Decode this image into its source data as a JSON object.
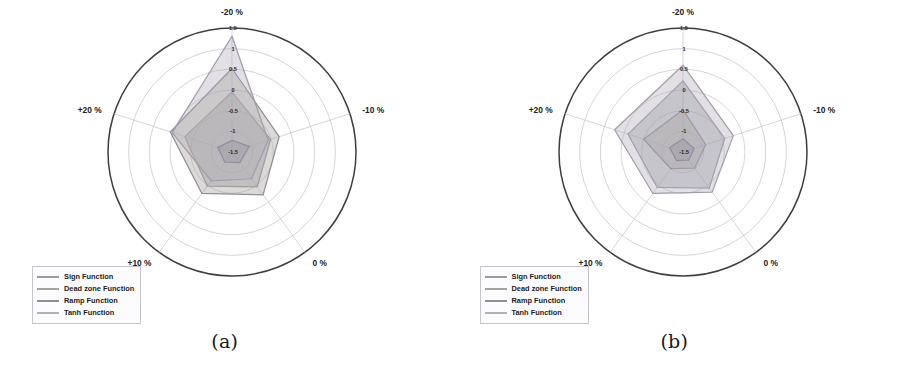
{
  "figure": {
    "panels": [
      {
        "caption": "(a)",
        "center_x": 232,
        "center_y": 152,
        "radius": 124
      },
      {
        "caption": "(b)",
        "center_x": 233,
        "center_y": 152,
        "radius": 124
      }
    ]
  },
  "legend": {
    "entries": [
      {
        "label": "Sign Function",
        "color": "#9a9aa6"
      },
      {
        "label": "Dead zone Function",
        "color": "#a8a29c"
      },
      {
        "label": "Ramp Function",
        "color": "#8e8e96"
      },
      {
        "label": "Tanh Function",
        "color": "#b3aeb8"
      }
    ]
  },
  "chart_data": [
    {
      "type": "radar",
      "title": "(a)",
      "categories": [
        "-20 %",
        "-10 %",
        "0 %",
        "+10 %",
        "+20 %"
      ],
      "rlim": [
        -1.5,
        1.5
      ],
      "rticks": [
        1.5,
        1,
        0.5,
        0,
        -0.5,
        -1,
        -1.5
      ],
      "rtick_labels": [
        "1.5",
        "1",
        "0.5",
        "0",
        "-0.5",
        "-1",
        "-1.5"
      ],
      "grid": true,
      "legend_position": "lower-left",
      "series": [
        {
          "name": "Sign Function",
          "values": [
            -0.05,
            -0.52,
            -0.46,
            -0.48,
            -0.3
          ],
          "color": "#9a9aa6",
          "fill": "rgba(150,150,162,0.42)"
        },
        {
          "name": "Dead zone Function",
          "values": [
            0.52,
            -0.3,
            -0.22,
            -0.26,
            0.07
          ],
          "color": "#8f8f99",
          "fill": "rgba(168,162,156,0.40)"
        },
        {
          "name": "Ramp Function",
          "values": [
            -1.22,
            -1.06,
            -1.18,
            -1.2,
            -1.14
          ],
          "color": "#7e7e88",
          "fill": "rgba(142,142,150,0.48)"
        },
        {
          "name": "Tanh Function",
          "values": [
            1.3,
            -0.58,
            -0.7,
            -0.64,
            0.02
          ],
          "color": "#a39eaa",
          "fill": "rgba(179,174,184,0.38)"
        }
      ]
    },
    {
      "type": "radar",
      "title": "(b)",
      "categories": [
        "-20 %",
        "-10 %",
        "0 %",
        "+10 %",
        "+20 %"
      ],
      "rlim": [
        -1.5,
        1.5
      ],
      "rticks": [
        1.5,
        1,
        0.5,
        0,
        -0.5,
        -1,
        -1.5
      ],
      "rtick_labels": [
        "1.5",
        "1",
        "0.5",
        "0",
        "-0.5",
        "-1",
        "-1.5"
      ],
      "grid": true,
      "legend_position": "lower-left",
      "series": [
        {
          "name": "Sign Function",
          "values": [
            0.22,
            -0.44,
            -0.42,
            -0.44,
            -0.1
          ],
          "color": "#9a9aa6",
          "fill": "rgba(150,150,162,0.42)"
        },
        {
          "name": "Dead zone Function",
          "values": [
            -0.48,
            -0.92,
            -1.02,
            -1.0,
            -0.5
          ],
          "color": "#8f8f99",
          "fill": "rgba(168,162,156,0.40)"
        },
        {
          "name": "Ramp Function",
          "values": [
            -1.18,
            -1.22,
            -1.26,
            -1.24,
            -1.16
          ],
          "color": "#7e7e88",
          "fill": "rgba(142,142,150,0.48)"
        },
        {
          "name": "Tanh Function",
          "values": [
            0.6,
            -0.22,
            -0.3,
            -0.26,
            0.24
          ],
          "color": "#a39eaa",
          "fill": "rgba(179,174,184,0.38)"
        }
      ]
    }
  ]
}
